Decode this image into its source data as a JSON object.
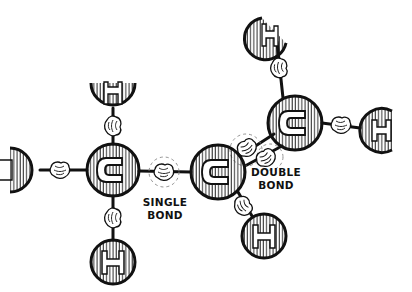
{
  "diagram": {
    "type": "molecule-cartoon",
    "atoms": [
      {
        "id": "c_left",
        "symbol": "C",
        "x": 113,
        "y": 170,
        "r": 26
      },
      {
        "id": "c_mid",
        "symbol": "C",
        "x": 218,
        "y": 172,
        "r": 27
      },
      {
        "id": "c_right",
        "symbol": "C",
        "x": 295,
        "y": 123,
        "r": 27
      },
      {
        "id": "h_top_left",
        "symbol": "H",
        "x": 113,
        "y": 90,
        "r": 22
      },
      {
        "id": "h_left",
        "symbol": "H",
        "x": 18,
        "y": 170,
        "r": 22
      },
      {
        "id": "h_bottom_left",
        "symbol": "H",
        "x": 113,
        "y": 262,
        "r": 22
      },
      {
        "id": "h_bottom_mid",
        "symbol": "H",
        "x": 264,
        "y": 236,
        "r": 22
      },
      {
        "id": "h_top_right",
        "symbol": "H",
        "x": 271,
        "y": 20,
        "r": 22
      },
      {
        "id": "h_right",
        "symbol": "H",
        "x": 380,
        "y": 130,
        "r": 22
      }
    ],
    "labels": {
      "single_bond_line1": "SINGLE",
      "single_bond_line2": "BOND",
      "double_bond_line1": "DOUBLE",
      "double_bond_line2": "BOND"
    },
    "colors": {
      "ink": "#111111",
      "background": "#ffffff",
      "dashed_circle": "#888888"
    }
  }
}
